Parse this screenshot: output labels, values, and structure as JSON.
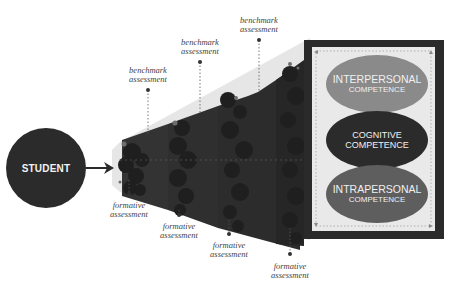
{
  "diagram": {
    "student": {
      "label": "STUDENT"
    },
    "benchmark_labels": [
      {
        "line1": "benchmark",
        "line2": "assessment"
      },
      {
        "line1": "benchmark",
        "line2": "assessment"
      },
      {
        "line1": "benchmark",
        "line2": "assessment"
      }
    ],
    "formative_labels": [
      {
        "line1": "formative",
        "line2": "assessment"
      },
      {
        "line1": "formative",
        "line2": "assessment"
      },
      {
        "line1": "formative",
        "line2": "assessment"
      },
      {
        "line1": "formative",
        "line2": "assessment"
      }
    ],
    "competencies": [
      {
        "title": "INTERPERSONAL",
        "subtitle": "COMPETENCE",
        "color": "#8a8a8a"
      },
      {
        "title": "COGNITIVE",
        "subtitle": "COMPETENCE",
        "color": "#2b2b2b"
      },
      {
        "title": "INTRAPERSONAL",
        "subtitle": "COMPETENCE",
        "color": "#5e5e5e"
      }
    ],
    "colors": {
      "student": "#2b2b2b",
      "funnel": "#e6e6e6",
      "stage": "#2e2e2e",
      "panel_frame": "#2a2a2a",
      "panel_fill": "#e9e9e9"
    }
  }
}
